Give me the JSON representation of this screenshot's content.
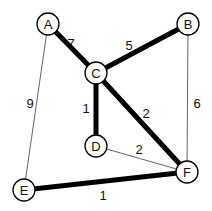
{
  "diagram": {
    "type": "weighted-undirected-graph",
    "highlight": "minimum-spanning-tree (thick edges)",
    "nodes": [
      {
        "id": "A",
        "label": "A",
        "x": 48,
        "y": 24
      },
      {
        "id": "B",
        "label": "B",
        "x": 188,
        "y": 24
      },
      {
        "id": "C",
        "label": "C",
        "x": 96,
        "y": 73
      },
      {
        "id": "D",
        "label": "D",
        "x": 96,
        "y": 146
      },
      {
        "id": "E",
        "label": "E",
        "x": 24,
        "y": 190
      },
      {
        "id": "F",
        "label": "F",
        "x": 187,
        "y": 172
      }
    ],
    "edges": [
      {
        "from": "A",
        "to": "C",
        "weight": "7",
        "thick": true,
        "label_x": 71,
        "label_y": 43
      },
      {
        "from": "C",
        "to": "B",
        "weight": "5",
        "thick": true,
        "label_x": 129,
        "label_y": 45
      },
      {
        "from": "C",
        "to": "D",
        "weight": "1",
        "thick": true,
        "label_x": 86,
        "label_y": 108
      },
      {
        "from": "C",
        "to": "F",
        "weight": "2",
        "thick": true,
        "label_x": 146,
        "label_y": 113
      },
      {
        "from": "E",
        "to": "F",
        "weight": "1",
        "thick": true,
        "label_x": 103,
        "label_y": 195
      },
      {
        "from": "A",
        "to": "E",
        "weight": "9",
        "thick": false,
        "label_x": 30,
        "label_y": 103
      },
      {
        "from": "B",
        "to": "F",
        "weight": "6",
        "thick": false,
        "label_x": 197,
        "label_y": 103
      },
      {
        "from": "D",
        "to": "F",
        "weight": "2",
        "thick": false,
        "label_x": 139,
        "label_y": 149
      }
    ],
    "node_radius": 11,
    "colors": {
      "stroke": "#000000",
      "thin_edge": "#555555",
      "background": "#ffffff"
    }
  }
}
